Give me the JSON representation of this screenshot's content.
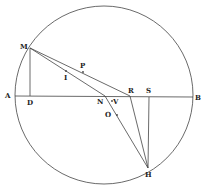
{
  "figure": {
    "colors": {
      "stroke": "#444444",
      "label": "#222222",
      "background": "#ffffff"
    },
    "circle": {
      "cx": 104,
      "cy": 95,
      "r": 89
    },
    "points": {
      "M": {
        "x": 30,
        "y": 48,
        "label": "M",
        "lx": 20,
        "ly": 49
      },
      "D": {
        "x": 30,
        "y": 96,
        "label": "D",
        "lx": 27,
        "ly": 105
      },
      "A": {
        "x": 15,
        "y": 96,
        "label": "A",
        "lx": 5,
        "ly": 98
      },
      "B": {
        "x": 193,
        "y": 97,
        "label": "B",
        "lx": 195,
        "ly": 100
      },
      "N": {
        "x": 105,
        "y": 96,
        "label": "N",
        "lx": 97,
        "ly": 104
      },
      "R": {
        "x": 130,
        "y": 96,
        "label": "R",
        "lx": 128,
        "ly": 93
      },
      "S": {
        "x": 149,
        "y": 97,
        "label": "S",
        "lx": 146,
        "ly": 93
      },
      "H": {
        "x": 148,
        "y": 168,
        "label": "H",
        "lx": 145,
        "ly": 177
      },
      "P": {
        "x": 83,
        "y": 72,
        "label": "P",
        "lx": 80,
        "ly": 68
      },
      "I": {
        "x": 66,
        "y": 71,
        "label": "I",
        "lx": 64,
        "ly": 80
      },
      "V": {
        "x": 112,
        "y": 101,
        "label": "V",
        "lx": 113,
        "ly": 104
      },
      "O": {
        "x": 117,
        "y": 115,
        "label": "O",
        "lx": 105,
        "ly": 117
      }
    },
    "segments": [
      [
        "A",
        "B"
      ],
      [
        "M",
        "D"
      ],
      [
        "M",
        "R"
      ],
      [
        "M",
        "N"
      ],
      [
        "N",
        "H"
      ],
      [
        "R",
        "H"
      ],
      [
        "S",
        "H"
      ]
    ]
  }
}
